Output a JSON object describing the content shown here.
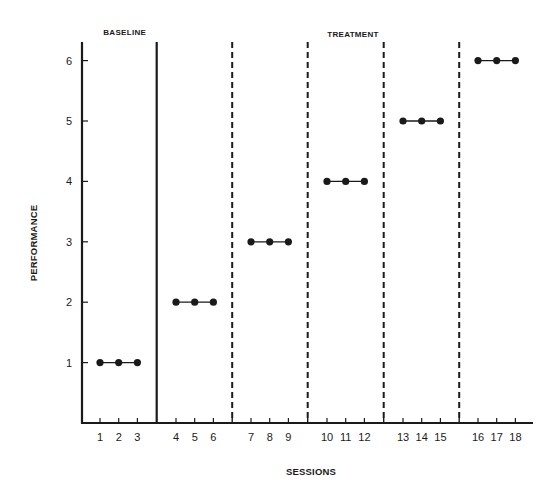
{
  "chart_data": {
    "type": "line",
    "title": "",
    "xlabel": "SESSIONS",
    "ylabel": "PERFORMANCE",
    "ylim": [
      0,
      6.3
    ],
    "yticks": [
      1,
      2,
      3,
      4,
      5,
      6
    ],
    "xticks": [
      "1",
      "2",
      "3",
      "4",
      "5",
      "6",
      "7",
      "8",
      "9",
      "10",
      "11",
      "12",
      "13",
      "14",
      "15",
      "16",
      "17",
      "18"
    ],
    "grid": false,
    "legend": null,
    "phases": [
      {
        "label": "BASELINE",
        "sessions": [
          1,
          2,
          3
        ]
      },
      {
        "label": "TREATMENT",
        "sessions": [
          4,
          5,
          6,
          7,
          8,
          9,
          10,
          11,
          12,
          13,
          14,
          15,
          16,
          17,
          18
        ]
      }
    ],
    "phase_change_line": {
      "style": "solid",
      "between_sessions": [
        3,
        4
      ]
    },
    "criterion_change_lines": [
      {
        "style": "dashed",
        "between_sessions": [
          6,
          7
        ]
      },
      {
        "style": "dashed",
        "between_sessions": [
          9,
          10
        ]
      },
      {
        "style": "dashed",
        "between_sessions": [
          12,
          13
        ]
      },
      {
        "style": "dashed",
        "between_sessions": [
          15,
          16
        ]
      }
    ],
    "series": [
      {
        "name": "Baseline",
        "x": [
          1,
          2,
          3
        ],
        "y": [
          1,
          1,
          1
        ]
      },
      {
        "name": "Treatment sub-phase 1",
        "x": [
          4,
          5,
          6
        ],
        "y": [
          2,
          2,
          2
        ]
      },
      {
        "name": "Treatment sub-phase 2",
        "x": [
          7,
          8,
          9
        ],
        "y": [
          3,
          3,
          3
        ]
      },
      {
        "name": "Treatment sub-phase 3",
        "x": [
          10,
          11,
          12
        ],
        "y": [
          4,
          4,
          4
        ]
      },
      {
        "name": "Treatment sub-phase 4",
        "x": [
          13,
          14,
          15
        ],
        "y": [
          5,
          5,
          5
        ]
      },
      {
        "name": "Treatment sub-phase 5",
        "x": [
          16,
          17,
          18
        ],
        "y": [
          6,
          6,
          6
        ]
      }
    ]
  },
  "layout": {
    "ink_color": "#1a1a1a",
    "background": "#ffffff"
  }
}
